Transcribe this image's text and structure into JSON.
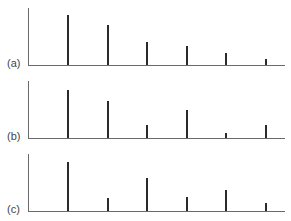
{
  "chart_data": {
    "type": "bar",
    "subtype": "stem",
    "title": "",
    "xlabel": "",
    "ylabel": "",
    "grid": false,
    "categories": [
      "1",
      "2",
      "3",
      "4",
      "5",
      "6"
    ],
    "ylim": [
      0,
      57
    ],
    "panels": [
      {
        "label": "(a)",
        "values": [
          50,
          40,
          23,
          19,
          12,
          6
        ]
      },
      {
        "label": "(b)",
        "values": [
          48,
          37,
          13,
          28,
          5,
          13
        ]
      },
      {
        "label": "(c)",
        "values": [
          49,
          13,
          33,
          14,
          21,
          8
        ]
      }
    ]
  },
  "layout": {
    "panel_tops": [
      8,
      81,
      154
    ],
    "axis_height": 57,
    "bar_x": [
      67,
      107,
      146,
      186,
      225,
      265
    ]
  }
}
